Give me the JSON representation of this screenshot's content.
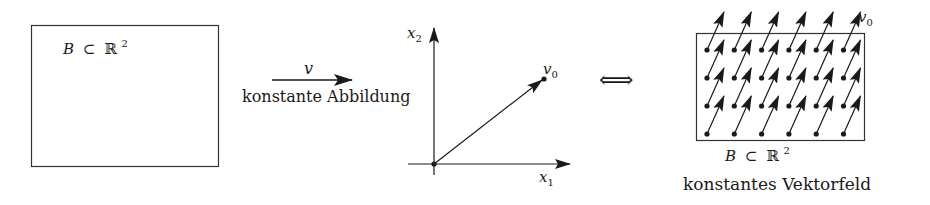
{
  "panels": {
    "domain": {
      "label": "B ⊂ ℝ²",
      "label_B": "B",
      "label_subset": "⊂",
      "label_R": "ℝ",
      "label_sup": "2"
    },
    "mapping_arrow": {
      "symbol": "v",
      "caption": "konstante Abbildung"
    },
    "vector_plot": {
      "x_axis_label": "x",
      "x_axis_sub": "1",
      "y_axis_label": "x",
      "y_axis_sub": "2",
      "vector_label": "v",
      "vector_sub": "0"
    },
    "equivalence": {
      "symbol": "⟺"
    },
    "vector_field": {
      "grid_cols": 6,
      "grid_rows": 4,
      "vector_label": "v",
      "vector_sub": "0",
      "domain_B": "B",
      "domain_subset": "⊂",
      "domain_R": "ℝ",
      "domain_sup": "2",
      "caption": "konstantes Vektorfeld"
    }
  },
  "colors": {
    "ink": "#1a1a1a",
    "background": "#ffffff"
  }
}
